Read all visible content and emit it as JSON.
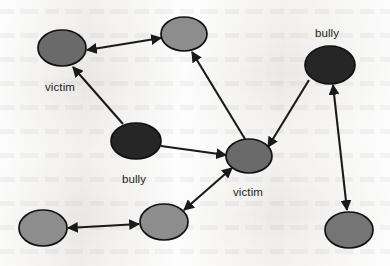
{
  "figure": {
    "kind": "social-network-diagram",
    "width": 390,
    "height": 266,
    "background_color": "#f3f2f0"
  },
  "palette": {
    "node_dark": "#262626",
    "node_medium": "#6a6a6a",
    "node_light": "#8d8d8d",
    "node_medium_light": "#757575",
    "edge": "#1a1a1a",
    "label": "#1c1c1c",
    "node_outline": "#111111"
  },
  "nodes": [
    {
      "id": "n1",
      "label": "victim",
      "label_position": "below",
      "role": "victim",
      "cx": 62,
      "cy": 48,
      "rx": 24,
      "ry": 18,
      "fill": "#6a6a6a",
      "label_x": 60,
      "label_y": 91
    },
    {
      "id": "n2",
      "label": "",
      "label_position": "none",
      "role": "neutral",
      "cx": 184,
      "cy": 34,
      "rx": 23,
      "ry": 17,
      "fill": "#8d8d8d",
      "label_x": 184,
      "label_y": 34
    },
    {
      "id": "n3",
      "label": "bully",
      "label_position": "above",
      "role": "bully",
      "cx": 330,
      "cy": 65,
      "rx": 25,
      "ry": 19,
      "fill": "#262626",
      "label_x": 327,
      "label_y": 37
    },
    {
      "id": "n4",
      "label": "bully",
      "label_position": "below",
      "role": "bully",
      "cx": 136,
      "cy": 141,
      "rx": 25,
      "ry": 18,
      "fill": "#262626",
      "label_x": 134,
      "label_y": 183
    },
    {
      "id": "n5",
      "label": "victim",
      "label_position": "below",
      "role": "victim",
      "cx": 249,
      "cy": 156,
      "rx": 23,
      "ry": 17,
      "fill": "#6a6a6a",
      "label_x": 248,
      "label_y": 196
    },
    {
      "id": "n6",
      "label": "",
      "label_position": "none",
      "role": "neutral",
      "cx": 43,
      "cy": 228,
      "rx": 24,
      "ry": 18,
      "fill": "#8d8d8d",
      "label_x": 43,
      "label_y": 228
    },
    {
      "id": "n7",
      "label": "",
      "label_position": "none",
      "role": "neutral",
      "cx": 164,
      "cy": 222,
      "rx": 24,
      "ry": 18,
      "fill": "#8d8d8d",
      "label_x": 164,
      "label_y": 222
    },
    {
      "id": "n8",
      "label": "",
      "label_position": "none",
      "role": "neutral",
      "cx": 349,
      "cy": 230,
      "rx": 24,
      "ry": 18,
      "fill": "#757575",
      "label_x": 349,
      "label_y": 230
    }
  ],
  "edges": [
    {
      "id": "e1",
      "source": "n2",
      "target": "n1",
      "direction": "both",
      "x1": 161,
      "y1": 38,
      "x2": 87,
      "y2": 50
    },
    {
      "id": "e2",
      "source": "n4",
      "target": "n1",
      "direction": "forward",
      "x1": 123,
      "y1": 124,
      "x2": 73,
      "y2": 67
    },
    {
      "id": "e3",
      "source": "n4",
      "target": "n5",
      "direction": "forward",
      "x1": 161,
      "y1": 146,
      "x2": 226,
      "y2": 155
    },
    {
      "id": "e4",
      "source": "n3",
      "target": "n5",
      "direction": "forward",
      "x1": 309,
      "y1": 80,
      "x2": 268,
      "y2": 147
    },
    {
      "id": "e5",
      "source": "n5",
      "target": "n2",
      "direction": "forward",
      "x1": 245,
      "y1": 139,
      "x2": 192,
      "y2": 52
    },
    {
      "id": "e6",
      "source": "n5",
      "target": "n7",
      "direction": "both",
      "x1": 232,
      "y1": 168,
      "x2": 184,
      "y2": 210
    },
    {
      "id": "e7",
      "source": "n3",
      "target": "n8",
      "direction": "both",
      "x1": 333,
      "y1": 85,
      "x2": 347,
      "y2": 210
    },
    {
      "id": "e8",
      "source": "n6",
      "target": "n7",
      "direction": "both",
      "x1": 68,
      "y1": 228,
      "x2": 139,
      "y2": 224
    }
  ]
}
